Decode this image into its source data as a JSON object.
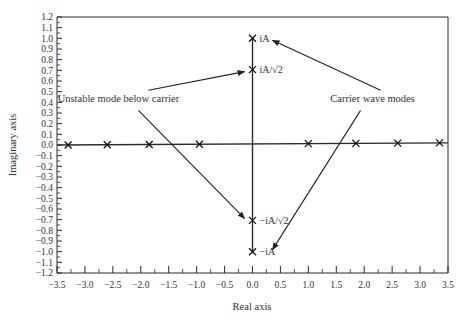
{
  "chart_data": {
    "type": "scatter",
    "title": "",
    "xlabel": "Real axis",
    "ylabel": "Imaginary axis",
    "xlim": [
      -3.5,
      3.5
    ],
    "ylim": [
      -1.2,
      1.2
    ],
    "grid": false,
    "legend": null,
    "x_ticks": [
      "-3.5",
      "-3.0",
      "-2.5",
      "-2.0",
      "-1.5",
      "-1.0",
      "-0.5",
      "0.0",
      "0.5",
      "1.0",
      "1.5",
      "2.0",
      "2.5",
      "3.0",
      "3.5"
    ],
    "y_ticks": [
      "1.2",
      "1.1",
      "1.0",
      "0.9",
      "0.8",
      "0.7",
      "0.6",
      "0.5",
      "0.4",
      "0.3",
      "0.2",
      "0.1",
      "0.0",
      "-0.1",
      "-0.2",
      "-0.3",
      "-0.4",
      "-0.5",
      "-0.6",
      "-0.7",
      "-0.8",
      "-0.9",
      "-1.0",
      "-1.1",
      "-1.2"
    ],
    "series": [
      {
        "name": "Real-axis modes",
        "marker": "x",
        "points": [
          {
            "x": -3.3,
            "y": 0.0
          },
          {
            "x": -2.6,
            "y": 0.0
          },
          {
            "x": -1.85,
            "y": 0.0
          },
          {
            "x": -0.95,
            "y": 0.0
          },
          {
            "x": 1.0,
            "y": 0.0
          },
          {
            "x": 1.85,
            "y": 0.0
          },
          {
            "x": 2.6,
            "y": 0.0
          },
          {
            "x": 3.35,
            "y": 0.0
          }
        ]
      },
      {
        "name": "Imaginary-axis modes",
        "marker": "x",
        "points": [
          {
            "x": 0.0,
            "y": 1.0,
            "label": "iA"
          },
          {
            "x": 0.0,
            "y": 0.707,
            "label": "iA/√2"
          },
          {
            "x": 0.0,
            "y": -0.707,
            "label": "−iA/√2"
          },
          {
            "x": 0.0,
            "y": -1.0,
            "label": "−iA"
          }
        ]
      }
    ],
    "lines": [
      {
        "name": "real-axis-line",
        "from": [
          -3.5,
          0.0
        ],
        "to": [
          3.5,
          0.02
        ]
      },
      {
        "name": "imag-axis-line",
        "from": [
          0.0,
          1.0
        ],
        "to": [
          0.0,
          -1.0
        ]
      }
    ],
    "annotations": [
      {
        "text": "Unstable mode below carrier",
        "x": -2.4,
        "y": 0.4,
        "arrows_to": [
          {
            "x": 0.0,
            "y": 0.707
          },
          {
            "x": 0.0,
            "y": -0.707
          }
        ]
      },
      {
        "text": "Carrier wave modes",
        "x": 2.15,
        "y": 0.4,
        "arrows_to": [
          {
            "x": 0.0,
            "y": 1.0
          },
          {
            "x": 0.0,
            "y": -1.0
          }
        ]
      }
    ]
  }
}
